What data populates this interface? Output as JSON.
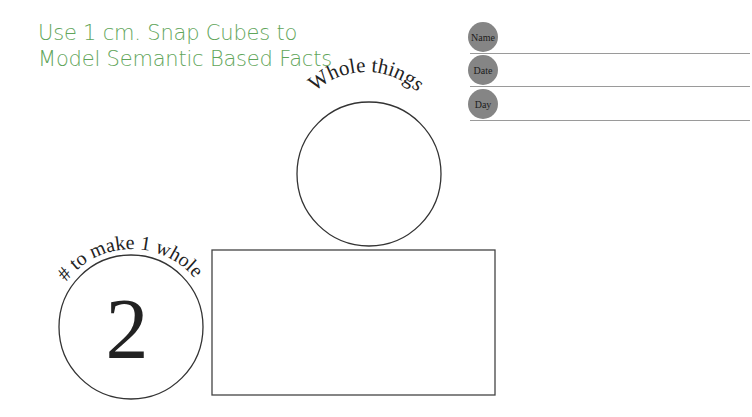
{
  "title": {
    "line1": "Use 1 cm. Snap Cubes to",
    "line2": "Model Semantic Based Facts",
    "color": "#5fa55a"
  },
  "fields": [
    {
      "label": "Name",
      "value": ""
    },
    {
      "label": "Date",
      "value": ""
    },
    {
      "label": "Day",
      "value": ""
    }
  ],
  "whole_circle": {
    "label": "Whole things",
    "value": ""
  },
  "parts_circle": {
    "label": "# to make 1 whole",
    "value": "2"
  },
  "model_box": {
    "content": ""
  }
}
